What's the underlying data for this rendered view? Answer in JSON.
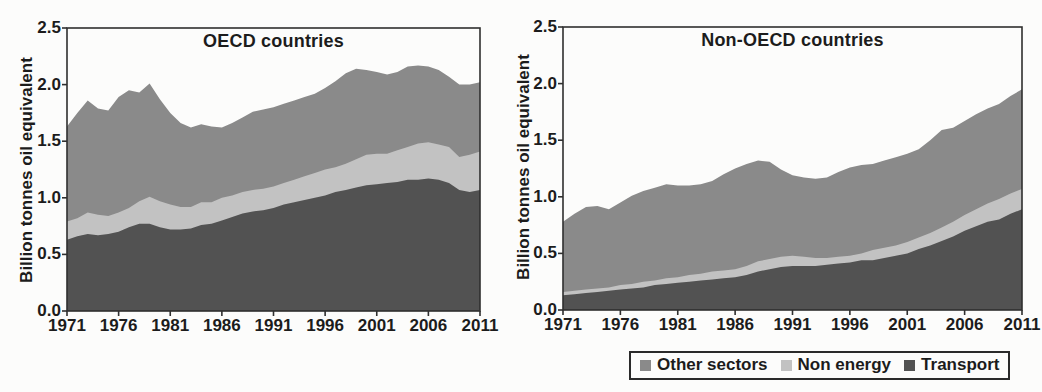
{
  "figure": {
    "background": "#fcfcfb",
    "text_color": "#1c1c1c",
    "axis_color": "#2f2f2f"
  },
  "legend": {
    "items": [
      {
        "label": "Other sectors",
        "color": "#8a8a8a"
      },
      {
        "label": "Non energy",
        "color": "#c2c2c2"
      },
      {
        "label": "Transport",
        "color": "#525252"
      }
    ]
  },
  "chart_data": [
    {
      "type": "area",
      "stacked": true,
      "title": "OECD countries",
      "ylabel": "Billion tonnes oil equivalent",
      "xlabel": "",
      "ylim": [
        0,
        2.5
      ],
      "yticks": [
        "0.0",
        "0.5",
        "1.0",
        "1.5",
        "2.0",
        "2.5"
      ],
      "xticks": [
        1971,
        1976,
        1981,
        1986,
        1991,
        1996,
        2001,
        2006,
        2011
      ],
      "grid": false,
      "legend_position": "bottom",
      "x": [
        1971,
        1972,
        1973,
        1974,
        1975,
        1976,
        1977,
        1978,
        1979,
        1980,
        1981,
        1982,
        1983,
        1984,
        1985,
        1986,
        1987,
        1988,
        1989,
        1990,
        1991,
        1992,
        1993,
        1994,
        1995,
        1996,
        1997,
        1998,
        1999,
        2000,
        2001,
        2002,
        2003,
        2004,
        2005,
        2006,
        2007,
        2008,
        2009,
        2010,
        2011
      ],
      "series": [
        {
          "name": "Transport",
          "color": "#525252",
          "values": [
            0.63,
            0.66,
            0.68,
            0.67,
            0.68,
            0.7,
            0.74,
            0.77,
            0.77,
            0.74,
            0.72,
            0.72,
            0.73,
            0.76,
            0.77,
            0.8,
            0.83,
            0.86,
            0.88,
            0.89,
            0.91,
            0.94,
            0.96,
            0.98,
            1.0,
            1.02,
            1.05,
            1.07,
            1.09,
            1.11,
            1.12,
            1.13,
            1.14,
            1.16,
            1.16,
            1.17,
            1.16,
            1.13,
            1.07,
            1.05,
            1.07
          ]
        },
        {
          "name": "Non energy",
          "color": "#c2c2c2",
          "values": [
            0.16,
            0.16,
            0.19,
            0.18,
            0.16,
            0.17,
            0.17,
            0.2,
            0.24,
            0.23,
            0.22,
            0.2,
            0.19,
            0.2,
            0.19,
            0.2,
            0.19,
            0.19,
            0.19,
            0.19,
            0.19,
            0.19,
            0.2,
            0.21,
            0.22,
            0.23,
            0.22,
            0.23,
            0.25,
            0.27,
            0.27,
            0.26,
            0.28,
            0.29,
            0.32,
            0.32,
            0.31,
            0.32,
            0.29,
            0.33,
            0.34
          ]
        },
        {
          "name": "Other sectors",
          "color": "#8a8a8a",
          "values": [
            0.84,
            0.93,
            0.99,
            0.94,
            0.93,
            1.02,
            1.04,
            0.96,
            1.0,
            0.9,
            0.81,
            0.74,
            0.7,
            0.69,
            0.67,
            0.62,
            0.64,
            0.66,
            0.69,
            0.7,
            0.7,
            0.7,
            0.7,
            0.7,
            0.7,
            0.72,
            0.76,
            0.8,
            0.8,
            0.75,
            0.72,
            0.7,
            0.69,
            0.71,
            0.69,
            0.67,
            0.66,
            0.62,
            0.64,
            0.62,
            0.61
          ]
        }
      ]
    },
    {
      "type": "area",
      "stacked": true,
      "title": "Non-OECD countries",
      "ylabel": "Billion tonnes oil equivalent",
      "xlabel": "",
      "ylim": [
        0,
        2.5
      ],
      "yticks": [
        "0.0",
        "0.5",
        "1.0",
        "1.5",
        "2.0",
        "2.5"
      ],
      "xticks": [
        1971,
        1976,
        1981,
        1986,
        1991,
        1996,
        2001,
        2006,
        2011
      ],
      "grid": false,
      "legend_position": "bottom",
      "x": [
        1971,
        1972,
        1973,
        1974,
        1975,
        1976,
        1977,
        1978,
        1979,
        1980,
        1981,
        1982,
        1983,
        1984,
        1985,
        1986,
        1987,
        1988,
        1989,
        1990,
        1991,
        1992,
        1993,
        1994,
        1995,
        1996,
        1997,
        1998,
        1999,
        2000,
        2001,
        2002,
        2003,
        2004,
        2005,
        2006,
        2007,
        2008,
        2009,
        2010,
        2011
      ],
      "series": [
        {
          "name": "Transport",
          "color": "#525252",
          "values": [
            0.13,
            0.14,
            0.15,
            0.16,
            0.17,
            0.18,
            0.19,
            0.2,
            0.22,
            0.23,
            0.24,
            0.25,
            0.26,
            0.27,
            0.28,
            0.29,
            0.31,
            0.34,
            0.36,
            0.38,
            0.39,
            0.39,
            0.39,
            0.4,
            0.41,
            0.42,
            0.44,
            0.44,
            0.46,
            0.48,
            0.5,
            0.54,
            0.57,
            0.61,
            0.65,
            0.7,
            0.74,
            0.78,
            0.8,
            0.85,
            0.89
          ]
        },
        {
          "name": "Non energy",
          "color": "#c2c2c2",
          "values": [
            0.03,
            0.03,
            0.03,
            0.03,
            0.03,
            0.04,
            0.04,
            0.05,
            0.04,
            0.05,
            0.05,
            0.06,
            0.06,
            0.07,
            0.07,
            0.07,
            0.08,
            0.09,
            0.09,
            0.09,
            0.09,
            0.08,
            0.07,
            0.06,
            0.06,
            0.06,
            0.06,
            0.09,
            0.09,
            0.09,
            0.1,
            0.1,
            0.11,
            0.12,
            0.13,
            0.14,
            0.15,
            0.16,
            0.18,
            0.18,
            0.18
          ]
        },
        {
          "name": "Other sectors",
          "color": "#8a8a8a",
          "values": [
            0.62,
            0.68,
            0.73,
            0.73,
            0.69,
            0.73,
            0.78,
            0.8,
            0.82,
            0.83,
            0.81,
            0.79,
            0.79,
            0.8,
            0.85,
            0.89,
            0.9,
            0.89,
            0.86,
            0.77,
            0.71,
            0.7,
            0.7,
            0.71,
            0.75,
            0.78,
            0.78,
            0.76,
            0.77,
            0.78,
            0.78,
            0.78,
            0.82,
            0.86,
            0.83,
            0.83,
            0.84,
            0.84,
            0.84,
            0.86,
            0.88
          ]
        }
      ]
    }
  ]
}
